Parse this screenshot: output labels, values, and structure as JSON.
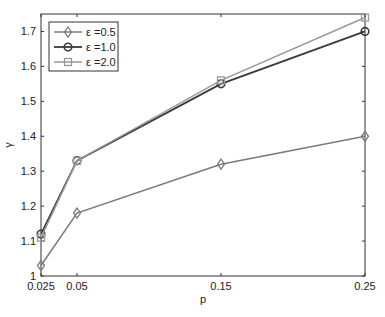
{
  "chart_data": {
    "type": "line",
    "title": "",
    "xlabel": "p",
    "ylabel": "γ",
    "x": [
      0.025,
      0.05,
      0.15,
      0.25
    ],
    "xticks": [
      "0.025",
      "0.05",
      "0.15",
      "0.25"
    ],
    "yticks": [
      "1",
      "1.1",
      "1.2",
      "1.3",
      "1.4",
      "1.5",
      "1.6",
      "1.7"
    ],
    "xlim": [
      0.025,
      0.25
    ],
    "ylim": [
      1.0,
      1.75
    ],
    "grid": false,
    "legend_position": "upper-left",
    "series": [
      {
        "name": "ε =0.5",
        "marker": "diamond",
        "color": "#7a7a7a",
        "values": [
          1.03,
          1.18,
          1.32,
          1.4
        ]
      },
      {
        "name": "ε =1.0",
        "marker": "circle",
        "color": "#3a3a3a",
        "values": [
          1.12,
          1.33,
          1.55,
          1.7
        ]
      },
      {
        "name": "ε =2.0",
        "marker": "square",
        "color": "#999999",
        "values": [
          1.11,
          1.33,
          1.56,
          1.74
        ]
      }
    ]
  }
}
